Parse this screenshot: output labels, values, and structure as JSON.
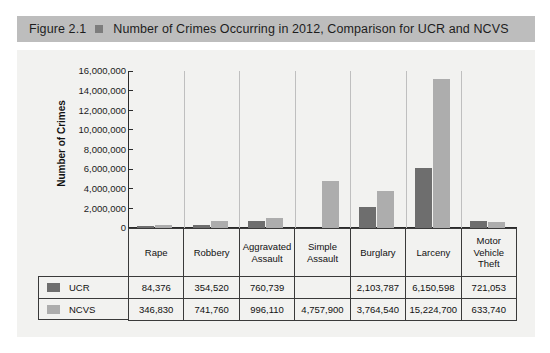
{
  "figure": {
    "number": "Figure 2.1",
    "bullet_icon": "square-bullet-icon",
    "title": "Number of Crimes Occurring in 2012, Comparison for UCR and NCVS"
  },
  "colors": {
    "banner": "#bdbdbd",
    "plot_background": "#f2f2f0",
    "ucr_series": "#6e6e6e",
    "ncvs_series": "#adadad",
    "axis": "#2b2b2b",
    "grid_separator": "#bfbfbf"
  },
  "chart_data": {
    "type": "bar",
    "title": "Number of Crimes Occurring in 2012, Comparison for UCR and NCVS",
    "xlabel": "",
    "ylabel": "Number of Crimes",
    "ylim": [
      0,
      16000000
    ],
    "ytick_labels": [
      "16,000,000",
      "14,000,000",
      "12,000,000",
      "10,000,000",
      "8,000,000",
      "6,000,000",
      "4,000,000",
      "2,000,000",
      "0"
    ],
    "ytick_values": [
      16000000,
      14000000,
      12000000,
      10000000,
      8000000,
      6000000,
      4000000,
      2000000,
      0
    ],
    "grid": false,
    "legend_position": "table-left",
    "categories": [
      "Rape",
      "Robbery",
      "Aggravated Assault",
      "Simple Assault",
      "Burglary",
      "Larceny",
      "Motor Vehicle Theft"
    ],
    "category_labels_wrapped": [
      "Rape",
      "Robbery",
      "Aggravated\nAssault",
      "Simple\nAssault",
      "Burglary",
      "Larceny",
      "Motor\nVehicle\nTheft"
    ],
    "series": [
      {
        "name": "UCR",
        "color": "#6e6e6e",
        "values": [
          84376,
          354520,
          760739,
          null,
          2103787,
          6150598,
          721053
        ],
        "labels": [
          "84,376",
          "354,520",
          "760,739",
          "",
          "2,103,787",
          "6,150,598",
          "721,053"
        ]
      },
      {
        "name": "NCVS",
        "color": "#adadad",
        "values": [
          346830,
          741760,
          996110,
          4757900,
          3764540,
          15224700,
          633740
        ],
        "labels": [
          "346,830",
          "741,760",
          "996,110",
          "4,757,900",
          "3,764,540",
          "15,224,700",
          "633,740"
        ]
      }
    ]
  }
}
